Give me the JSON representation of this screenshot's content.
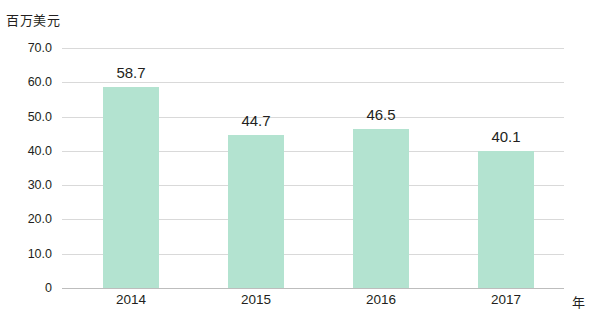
{
  "chart_data": {
    "type": "bar",
    "title": "",
    "unit_label": "百万美元",
    "xlabel": "年",
    "ylabel": "",
    "categories": [
      "2014",
      "2015",
      "2016",
      "2017"
    ],
    "values": [
      58.7,
      44.7,
      46.5,
      40.1
    ],
    "data_labels": [
      "58.7",
      "44.7",
      "46.5",
      "40.1"
    ],
    "ylim": [
      0,
      70
    ],
    "y_ticks": [
      0,
      10,
      20,
      30,
      40,
      50,
      60,
      70
    ],
    "y_tick_labels": [
      "0",
      "10.0",
      "20.0",
      "30.0",
      "40.0",
      "50.0",
      "60.0",
      "70.0"
    ],
    "grid": true,
    "legend": "none",
    "bar_color": "#b3e3d0",
    "grid_color": "#d9d9d9",
    "text_color": "#231f20"
  }
}
